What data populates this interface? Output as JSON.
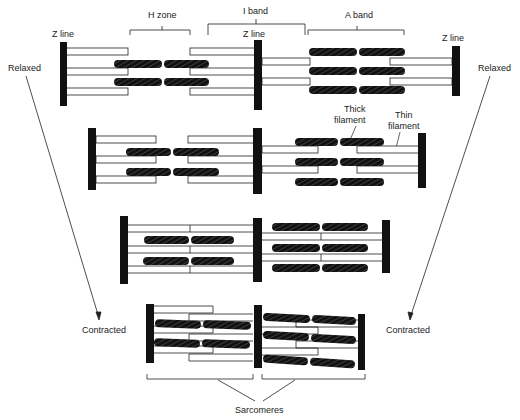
{
  "labels": {
    "h_zone": "H zone",
    "i_band": "I band",
    "a_band": "A band",
    "z_line_left": "Z line",
    "z_line_mid": "Z line",
    "z_line_right": "Z line",
    "relaxed_left": "Relaxed",
    "relaxed_right": "Relaxed",
    "contracted_left": "Contracted",
    "contracted_right": "Contracted",
    "thick_filament_1": "Thick",
    "thick_filament_2": "filament",
    "thin_filament_1": "Thin",
    "thin_filament_2": "filament",
    "sarcomeres": "Sarcomeres"
  },
  "colors": {
    "ink": "#111111",
    "background": "#ffffff"
  }
}
